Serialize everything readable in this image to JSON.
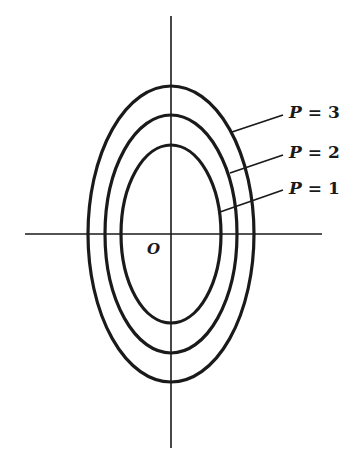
{
  "figure": {
    "origin_label": "O",
    "stroke_color": "#1a1a1a",
    "background": "#ffffff",
    "axes": {
      "horizontal": {
        "x1": 25,
        "x2": 322,
        "y": 234
      },
      "vertical": {
        "x": 171,
        "y1": 16,
        "y2": 448
      }
    },
    "center": {
      "x": 171,
      "y": 234
    },
    "contours": [
      {
        "label_var": "P",
        "label_eq": " = ",
        "label_val": "3",
        "rx": 83,
        "ry": 148,
        "leader": {
          "x1": 232,
          "y1": 132,
          "x2": 283,
          "y2": 115
        },
        "label_pos": {
          "x": 289,
          "y": 104
        }
      },
      {
        "label_var": "P",
        "label_eq": " = ",
        "label_val": "2",
        "rx": 66,
        "ry": 119,
        "leader": {
          "x1": 230,
          "y1": 173,
          "x2": 283,
          "y2": 155
        },
        "label_pos": {
          "x": 289,
          "y": 144
        }
      },
      {
        "label_var": "P",
        "label_eq": " = ",
        "label_val": "1",
        "rx": 50,
        "ry": 89,
        "leader": {
          "x1": 220,
          "y1": 212,
          "x2": 283,
          "y2": 190
        },
        "label_pos": {
          "x": 289,
          "y": 180
        }
      }
    ]
  }
}
